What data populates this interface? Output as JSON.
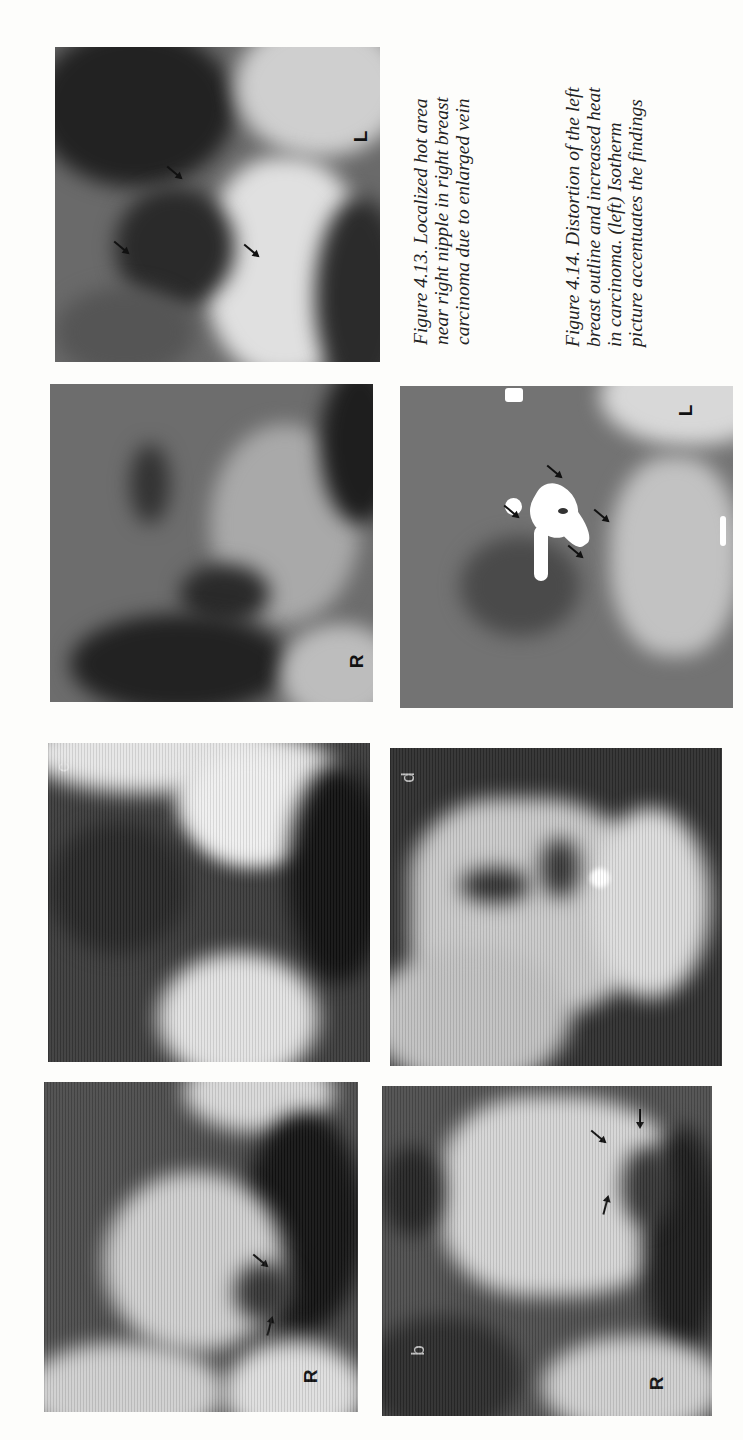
{
  "page": {
    "orientation": "rotated-90-ccw",
    "background": "#fdfdfb"
  },
  "figure_4_13": {
    "caption_lines": [
      "Figure 4.13. Localized hot area",
      "near right nipple in right breast",
      "carcinoma due to enlarged vein"
    ],
    "image": {
      "side_marker": "L",
      "arrow_count": 3
    }
  },
  "figure_4_14": {
    "caption_lines": [
      "Figure 4.14. Distortion of the left",
      "breast outline and increased heat",
      "in carcinoma. (left) Isotherm",
      "picture accentuates the findings"
    ],
    "left_image": {
      "side_marker": "R"
    },
    "right_image": {
      "side_marker": "L",
      "arrow_count": 4,
      "description": "isotherm"
    }
  },
  "thermogram_series": {
    "panels": [
      {
        "letter": "c",
        "side_marker": ""
      },
      {
        "letter": "d",
        "side_marker": ""
      },
      {
        "letter": "",
        "side_marker": "R",
        "arrow_count": 3
      },
      {
        "letter": "b",
        "side_marker": "R",
        "arrow_count": 3
      }
    ]
  }
}
